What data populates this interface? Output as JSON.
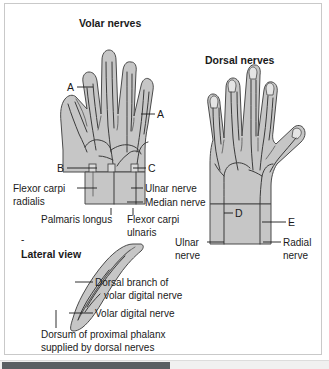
{
  "figure": {
    "kind": "anatomical-illustration",
    "panels": {
      "volar": {
        "title": "Volar nerves",
        "letters": [
          "A",
          "A",
          "B",
          "C"
        ],
        "labels": [
          "Flexor carpi radialis",
          "Palmaris longus",
          "Ulnar nerve",
          "Median nerve",
          "Flexor carpi ulnaris"
        ],
        "label_lines": {
          "flexor_carpi_radialis_1": "Flexor carpi",
          "flexor_carpi_radialis_2": "radialis",
          "palmaris_longus": "Palmaris longus",
          "ulnar_nerve": "Ulnar nerve",
          "median_nerve": "Median nerve",
          "flexor_carpi_ulnaris_1": "Flexor carpi",
          "flexor_carpi_ulnaris_2": "ulnaris"
        }
      },
      "dorsal": {
        "title": "Dorsal nerves",
        "letters": [
          "D",
          "E"
        ],
        "label_lines": {
          "ulnar_nerve_1": "Ulnar",
          "ulnar_nerve_2": "nerve",
          "radial_nerve_1": "Radial",
          "radial_nerve_2": "nerve"
        },
        "labels": [
          "Ulnar nerve",
          "Radial nerve"
        ]
      },
      "lateral": {
        "title": "Lateral view",
        "label_lines": {
          "dorsal_branch_1": "Dorsal branch of",
          "dorsal_branch_2": "volar digital nerve",
          "volar_digital": "Volar digital nerve",
          "dorsum_1": "Dorsum of proximal phalanx",
          "dorsum_2": "supplied by dorsal nerves"
        },
        "labels": [
          "Dorsal branch of volar digital nerve",
          "Volar digital nerve",
          "Dorsum of proximal phalanx supplied by dorsal nerves"
        ]
      }
    }
  },
  "colors": {
    "skin_fill": "#c6c6c6",
    "skin_light": "#dcdcdc",
    "outline": "#4a4a4a",
    "nerve": "#3b3b3b",
    "text": "#1a1a1a",
    "frame_border": "#c9c9c9",
    "page_background": "#ffffff",
    "scrollbar_track": "#f0f0f0",
    "scrollbar_thumb": "#5a5f63"
  },
  "scrollbar": {
    "orientation": "horizontal",
    "thumb_label": "horizontal-scroll-thumb"
  }
}
